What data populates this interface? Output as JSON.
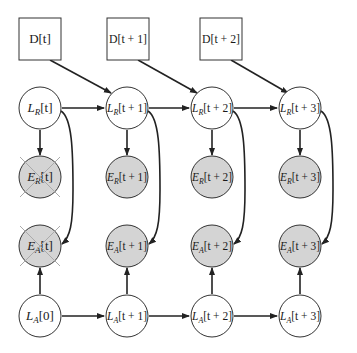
{
  "diagram": {
    "type": "dynamic-bayesian-network",
    "colors": {
      "stroke": "#333333",
      "observed_fill": "#d4d4d4",
      "latent_fill": "#ffffff",
      "cross": "#b0b0b0"
    },
    "data_boxes": [
      {
        "id": "D_t",
        "label": "D[t]"
      },
      {
        "id": "D_t1",
        "label": "D[t + 1]"
      },
      {
        "id": "D_t2",
        "label": "D[t + 2]"
      }
    ],
    "nodes": {
      "LR": [
        {
          "id": "LR_t",
          "var": "L",
          "sub": "R",
          "idx": "[t]"
        },
        {
          "id": "LR_t1",
          "var": "L",
          "sub": "R",
          "idx": "[t + 1]"
        },
        {
          "id": "LR_t2",
          "var": "L",
          "sub": "R",
          "idx": "[t + 2]"
        },
        {
          "id": "LR_t3",
          "var": "L",
          "sub": "R",
          "idx": "[t + 3]"
        }
      ],
      "ER": [
        {
          "id": "ER_t",
          "var": "E",
          "sub": "R",
          "idx": "[t]",
          "crossed": true
        },
        {
          "id": "ER_t1",
          "var": "E",
          "sub": "R",
          "idx": "[t + 1]"
        },
        {
          "id": "ER_t2",
          "var": "E",
          "sub": "R",
          "idx": "[t + 2]"
        },
        {
          "id": "ER_t3",
          "var": "E",
          "sub": "R",
          "idx": "[t + 3]"
        }
      ],
      "EA": [
        {
          "id": "EA_t",
          "var": "E",
          "sub": "A",
          "idx": "[t]",
          "crossed": true
        },
        {
          "id": "EA_t1",
          "var": "E",
          "sub": "A",
          "idx": "[t + 1]"
        },
        {
          "id": "EA_t2",
          "var": "E",
          "sub": "A",
          "idx": "[t + 2]"
        },
        {
          "id": "EA_t3",
          "var": "E",
          "sub": "A",
          "idx": "[t + 3]"
        }
      ],
      "LA": [
        {
          "id": "LA_0",
          "var": "L",
          "sub": "A",
          "idx": "[0]"
        },
        {
          "id": "LA_t1",
          "var": "L",
          "sub": "A",
          "idx": "[t + 1]"
        },
        {
          "id": "LA_t2",
          "var": "L",
          "sub": "A",
          "idx": "[t + 2]"
        },
        {
          "id": "LA_t3",
          "var": "L",
          "sub": "A",
          "idx": "[t + 3]"
        }
      ]
    },
    "edges": [
      [
        "D_t",
        "LR_t1"
      ],
      [
        "D_t1",
        "LR_t2"
      ],
      [
        "D_t2",
        "LR_t3"
      ],
      [
        "LR_t",
        "LR_t1"
      ],
      [
        "LR_t1",
        "LR_t2"
      ],
      [
        "LR_t2",
        "LR_t3"
      ],
      [
        "LR_t",
        "ER_t"
      ],
      [
        "LR_t1",
        "ER_t1"
      ],
      [
        "LR_t2",
        "ER_t2"
      ],
      [
        "LR_t3",
        "ER_t3"
      ],
      [
        "LR_t",
        "EA_t"
      ],
      [
        "LR_t1",
        "EA_t1"
      ],
      [
        "LR_t2",
        "EA_t2"
      ],
      [
        "LR_t3",
        "EA_t3"
      ],
      [
        "LA_0",
        "EA_t"
      ],
      [
        "LA_t1",
        "EA_t1"
      ],
      [
        "LA_t2",
        "EA_t2"
      ],
      [
        "LA_t3",
        "EA_t3"
      ],
      [
        "LA_0",
        "LA_t1"
      ],
      [
        "LA_t1",
        "LA_t2"
      ],
      [
        "LA_t2",
        "LA_t3"
      ]
    ]
  }
}
